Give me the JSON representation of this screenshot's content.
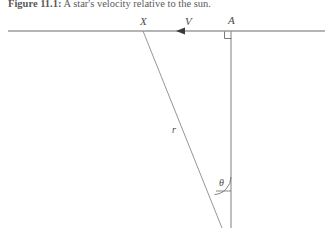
{
  "figure": {
    "caption_label": "Figure 11.1:",
    "caption_text": " A star's velocity relative to the sun.",
    "caption_full": "Figure 11.1: A star's velocity relative to the sun."
  },
  "diagram": {
    "type": "geometry-diagram",
    "stroke_color": "#6b6b6b",
    "text_color": "#4a4a4a",
    "background": "#ffffff",
    "labels": {
      "point_x": "X",
      "velocity": "V",
      "point_a": "A",
      "radius": "r",
      "angle": "θ"
    },
    "elements": {
      "horizontal_line": {
        "x1": 8,
        "y1": 31,
        "x2": 325,
        "y2": 31
      },
      "vertical_line": {
        "x1": 231,
        "y1": 31,
        "x2": 231,
        "y2": 228
      },
      "diagonal_line": {
        "x1": 143,
        "y1": 31,
        "x2": 222,
        "y2": 228
      },
      "velocity_arrowhead": {
        "x": 178,
        "y": 31,
        "direction": "left"
      },
      "right_angle_marker": {
        "x": 225,
        "y": 31,
        "size": 7
      },
      "angle_arc": {
        "cx": 231,
        "cy": 195,
        "radius": 18
      }
    }
  }
}
